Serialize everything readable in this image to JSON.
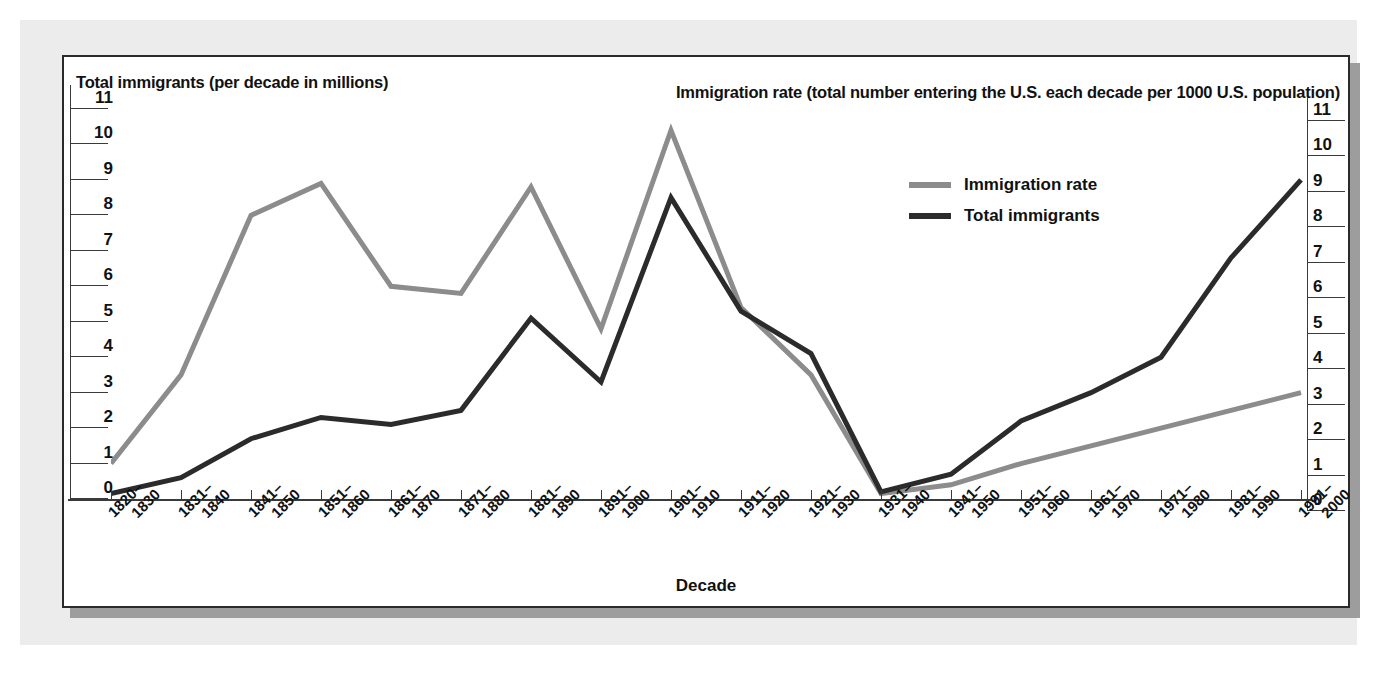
{
  "figure": {
    "left_axis_title": "Total immigrants (per decade in millions)",
    "right_axis_title": "Immigration rate (total number entering the U.S. each decade per 1000 U.S. population)",
    "x_axis_title": "Decade"
  },
  "legend": {
    "items": [
      {
        "label": "Immigration rate",
        "color": "#8c8c8c"
      },
      {
        "label": "Total immigrants",
        "color": "#2b2b2b"
      }
    ]
  },
  "colors": {
    "immigration_rate": "#8c8c8c",
    "total_immigrants": "#2b2b2b",
    "axis": "#3a3a3a",
    "text": "#111111",
    "panel_border": "#2a2a2a",
    "page_background": "#ececec",
    "panel_background": "#ffffff",
    "shadow": "#9d9d9d"
  },
  "chart_data": {
    "type": "line",
    "title": "",
    "xlabel": "Decade",
    "ylabel": "Total immigrants (per decade in millions)",
    "y2label": "Immigration rate (total number entering the U.S. each decade per 1000 U.S. population)",
    "ylim": [
      0,
      11
    ],
    "y2lim": [
      0,
      11
    ],
    "yticks": [
      0,
      1,
      2,
      3,
      4,
      5,
      6,
      7,
      8,
      9,
      10,
      11
    ],
    "y2ticks": [
      0,
      1,
      2,
      3,
      4,
      5,
      6,
      7,
      8,
      9,
      10,
      11
    ],
    "grid": false,
    "legend_position": "upper right",
    "categories": [
      "1820–1830",
      "1831–1840",
      "1841–1850",
      "1851–1860",
      "1861–1870",
      "1871–1880",
      "1881–1890",
      "1891–1900",
      "1901–1910",
      "1911–1920",
      "1921–1930",
      "1931–1940",
      "1941–1950",
      "1951–1960",
      "1961–1970",
      "1971–1980",
      "1981–1990",
      "1991–2000"
    ],
    "categories_lines": [
      [
        "1820–",
        "1830"
      ],
      [
        "1831–",
        "1840"
      ],
      [
        "1841–",
        "1850"
      ],
      [
        "1851–",
        "1860"
      ],
      [
        "1861–",
        "1870"
      ],
      [
        "1871–",
        "1880"
      ],
      [
        "1881–",
        "1890"
      ],
      [
        "1891–",
        "1900"
      ],
      [
        "1901–",
        "1910"
      ],
      [
        "1911–",
        "1920"
      ],
      [
        "1921–",
        "1930"
      ],
      [
        "1931–",
        "1940"
      ],
      [
        "1941–",
        "1950"
      ],
      [
        "1951–",
        "1960"
      ],
      [
        "1961–",
        "1970"
      ],
      [
        "1971–",
        "1980"
      ],
      [
        "1981–",
        "1990"
      ],
      [
        "1991–",
        "2000"
      ]
    ],
    "series": [
      {
        "name": "Immigration rate",
        "axis": "right",
        "color": "#8c8c8c",
        "values": [
          1.0,
          3.5,
          8.0,
          8.9,
          6.0,
          5.8,
          8.8,
          4.8,
          10.4,
          5.4,
          3.5,
          0.15,
          0.4,
          1.0,
          1.5,
          2.0,
          2.5,
          3.0
        ]
      },
      {
        "name": "Total immigrants",
        "axis": "left",
        "color": "#2b2b2b",
        "values": [
          0.15,
          0.6,
          1.7,
          2.3,
          2.1,
          2.5,
          5.1,
          3.3,
          8.5,
          5.3,
          4.1,
          0.2,
          0.7,
          2.2,
          3.0,
          4.0,
          6.8,
          9.0
        ]
      }
    ]
  }
}
